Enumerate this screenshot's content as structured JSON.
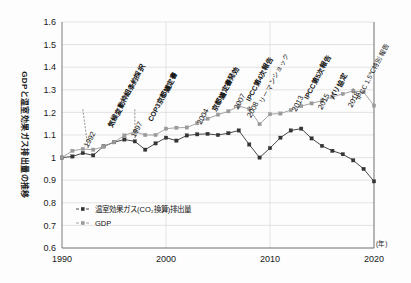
{
  "chart_data": {
    "type": "line",
    "title": "",
    "ylabel": "GDPと温室効果ガス排出量の推移",
    "xlabel": "(年)",
    "xlim": [
      1990,
      2020
    ],
    "ylim": [
      0.6,
      1.6
    ],
    "ytick_labels": [
      "1.6",
      "1.5",
      "1.4",
      "1.3",
      "1.2",
      "1.1",
      "1",
      "0.9",
      "0.8",
      "0.7",
      "0.6"
    ],
    "ytick_values": [
      1.6,
      1.5,
      1.4,
      1.3,
      1.2,
      1.1,
      1.0,
      0.9,
      0.8,
      0.7,
      0.6
    ],
    "xtick_labels": [
      "1990",
      "2000",
      "2010",
      "2020"
    ],
    "xtick_values": [
      1990,
      2000,
      2010,
      2020
    ],
    "grid": true,
    "legend_position": "inside-bottom-left",
    "x": [
      1990,
      1991,
      1992,
      1993,
      1994,
      1995,
      1996,
      1997,
      1998,
      1999,
      2000,
      2001,
      2002,
      2003,
      2004,
      2005,
      2006,
      2007,
      2008,
      2009,
      2010,
      2011,
      2012,
      2013,
      2014,
      2015,
      2016,
      2017,
      2018,
      2019,
      2020
    ],
    "series": [
      {
        "name": "温室効果ガス(CO₂換算)排出量",
        "color": "#333333",
        "marker": "square",
        "values": [
          1.0,
          1.005,
          1.02,
          1.01,
          1.05,
          1.068,
          1.08,
          1.072,
          1.035,
          1.063,
          1.088,
          1.075,
          1.098,
          1.103,
          1.105,
          1.1,
          1.108,
          1.12,
          1.058,
          1.0,
          1.042,
          1.088,
          1.12,
          1.128,
          1.085,
          1.052,
          1.03,
          1.015,
          0.988,
          0.95,
          0.895
        ]
      },
      {
        "name": "GDP",
        "color": "#9a9a9a",
        "marker": "square",
        "values": [
          1.0,
          1.03,
          1.038,
          1.035,
          1.048,
          1.068,
          1.098,
          1.115,
          1.1,
          1.1,
          1.128,
          1.132,
          1.133,
          1.152,
          1.172,
          1.19,
          1.205,
          1.228,
          1.215,
          1.148,
          1.192,
          1.195,
          1.21,
          1.228,
          1.24,
          1.252,
          1.268,
          1.282,
          1.295,
          1.29,
          1.23
        ]
      }
    ],
    "annotations": [
      {
        "year": "1992",
        "text": "気候変動枠組条約採択",
        "x": 1992
      },
      {
        "year": "1997",
        "text": "COP3京都議定書",
        "x": 1997
      },
      {
        "year": "2004",
        "text": "京都議定書発効",
        "x": 2004
      },
      {
        "year": "2007",
        "text": "IPCC第4次報告",
        "x": 2007
      },
      {
        "year": "2008",
        "text": "リーマンショック",
        "x": 2008
      },
      {
        "year": "2013",
        "text": "IPCC第5次報告",
        "x": 2013
      },
      {
        "year": "2015",
        "text": "パリ協定",
        "x": 2015
      },
      {
        "year": "2018",
        "text": "IPCC 1.5℃特別報告",
        "x": 2018
      }
    ],
    "legend": [
      {
        "label": "温室効果ガス(CO₂換算)排出量",
        "color": "#333333"
      },
      {
        "label": "GDP",
        "color": "#9a9a9a"
      }
    ]
  }
}
